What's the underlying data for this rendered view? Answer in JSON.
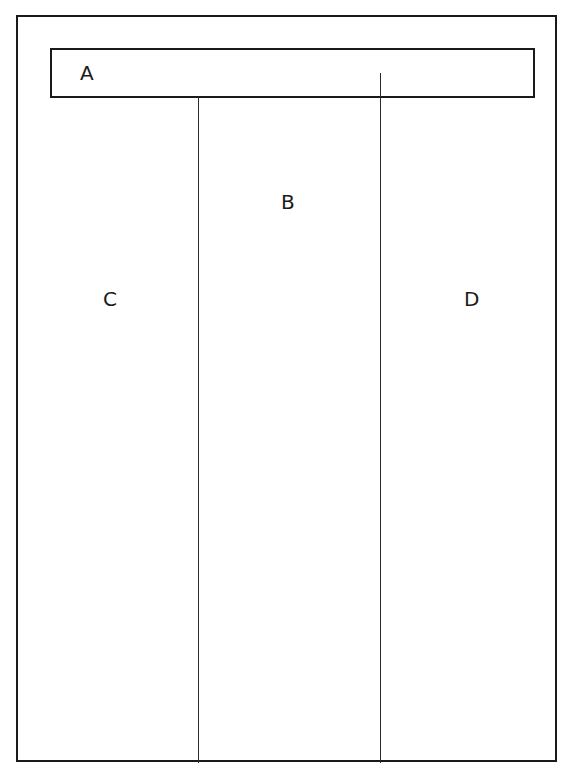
{
  "diagram": {
    "regions": [
      {
        "id": "A",
        "label": "A",
        "role": "header"
      },
      {
        "id": "B",
        "label": "B",
        "role": "center-column"
      },
      {
        "id": "C",
        "label": "C",
        "role": "left-column"
      },
      {
        "id": "D",
        "label": "D",
        "role": "right-column"
      }
    ],
    "colors": {
      "line": "#1a1a1a",
      "background": "#ffffff"
    }
  }
}
